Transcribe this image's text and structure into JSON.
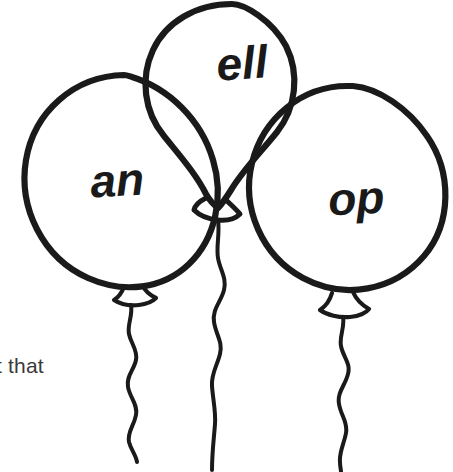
{
  "illustration": {
    "name": "three-balloons-word-families",
    "background_color": "#ffffff",
    "ink_color": "#1a1a1a",
    "balloons": [
      {
        "id": "balloon-an",
        "label": "an",
        "position": "left",
        "label_x": 118,
        "label_y": 196,
        "label_size": 46,
        "label_rotation": -3
      },
      {
        "id": "balloon-ell",
        "label": "ell",
        "position": "top-center",
        "label_x": 243,
        "label_y": 79,
        "label_size": 46,
        "label_rotation": -4
      },
      {
        "id": "balloon-op",
        "label": "op",
        "position": "right",
        "label_x": 357,
        "label_y": 214,
        "label_size": 46,
        "label_rotation": -3
      }
    ]
  },
  "caption": {
    "text": "t that",
    "color": "#3a3a3a"
  }
}
